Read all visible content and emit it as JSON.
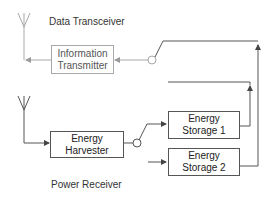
{
  "diagram": {
    "sections": {
      "data_transceiver": "Data Transceiver",
      "power_receiver": "Power Receiver"
    },
    "blocks": {
      "information_transmitter": [
        "Information",
        "Transmitter"
      ],
      "energy_harvester": [
        "Energy",
        "Harvester"
      ],
      "energy_storage_1": [
        "Energy",
        "Storage 1"
      ],
      "energy_storage_2": [
        "Energy",
        "Storage 2"
      ]
    },
    "colors": {
      "active_line": "#555555",
      "inactive_line": "#a8a8a8"
    }
  }
}
